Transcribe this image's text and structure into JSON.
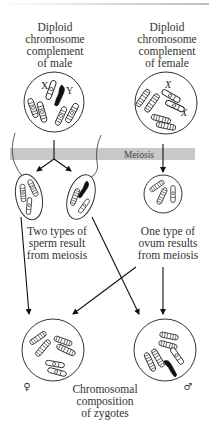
{
  "diagram": {
    "male_parent": {
      "label_lines": [
        "Diploid",
        "chromosome",
        "complement",
        "of male"
      ],
      "chromosome_labels": [
        "X",
        "Y"
      ]
    },
    "female_parent": {
      "label_lines": [
        "Diploid",
        "chromosome",
        "complement",
        "of female"
      ],
      "chromosome_labels": [
        "X",
        "X"
      ]
    },
    "process_band": {
      "label": "Meiosis",
      "color": "#c8c8c8"
    },
    "sperm": {
      "label_lines": [
        "Two types of",
        "sperm result",
        "from meiosis"
      ]
    },
    "ovum": {
      "label_lines": [
        "One type of",
        "ovum results",
        "from meiosis"
      ]
    },
    "zygotes": {
      "female_symbol": "♀",
      "male_symbol": "♂",
      "label_lines": [
        "Chromosomal",
        "composition",
        "of zygotes"
      ]
    }
  }
}
